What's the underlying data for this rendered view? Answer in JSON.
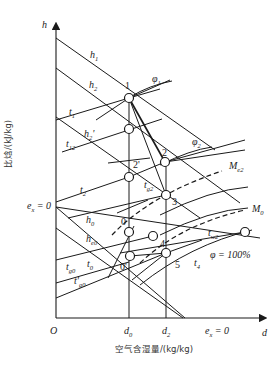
{
  "diagram": {
    "type": "psychrometric h-d chart",
    "axes": {
      "y_symbol": "h",
      "y_label": "比焓/(kJ/kg)",
      "x_symbol": "d",
      "x_label": "空气含湿量/(kg/kg)",
      "origin": "O"
    },
    "x_ticks": [
      {
        "main": "d",
        "sub": "0"
      },
      {
        "main": "d",
        "sub": "2"
      }
    ],
    "ex_zero_x": {
      "main": "e",
      "sub": "x",
      "rest": " = 0"
    },
    "ex_zero_y": {
      "main": "e",
      "sub": "x",
      "rest": " = 0"
    },
    "enthalpy_lines": [
      {
        "main": "h",
        "sub": "1"
      },
      {
        "main": "h",
        "sub": "2"
      },
      {
        "main": "h",
        "sub": "2",
        "prime": "'"
      },
      {
        "main": "h",
        "sub": "0"
      },
      {
        "main": "h",
        "sub": "e0"
      }
    ],
    "temperature_lines": [
      {
        "main": "t",
        "sub": "1"
      },
      {
        "main": "t",
        "sub": "12"
      },
      {
        "main": "t",
        "sub": "2"
      },
      {
        "main": "t",
        "sub": "g2"
      },
      {
        "main": "t",
        "sub": "g0"
      },
      {
        "main": "t",
        "sub": "0"
      },
      {
        "main": "t",
        "sub": "g0",
        "prime": "'"
      },
      {
        "main": "t",
        "sub": "w2"
      },
      {
        "main": "t",
        "sub": "4"
      }
    ],
    "humidity_lines": [
      {
        "main": "φ",
        "sub": "1"
      },
      {
        "main": "φ",
        "sub": "2"
      },
      {
        "main": "φ",
        "rest": " = 100%"
      }
    ],
    "exergy_lines": [
      {
        "main": "M",
        "sub": "e2"
      },
      {
        "main": "M",
        "sub": "0"
      }
    ],
    "points": [
      "1",
      "2",
      "2'",
      "3",
      "0",
      "0'",
      "4",
      "5"
    ],
    "colors": {
      "line": "#1a1a1a",
      "background": "#ffffff"
    }
  }
}
